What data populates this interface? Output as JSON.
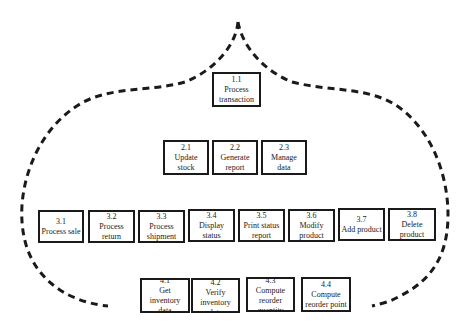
{
  "diagram": {
    "type": "process decomposition chart",
    "outline": "dashed onion-dome boundary",
    "colors": {
      "line": "#1a1a1a",
      "background": "#ffffff"
    },
    "level1": [
      {
        "id": "1.1",
        "label": "Process transaction"
      }
    ],
    "level2": [
      {
        "id": "2.1",
        "label": "Update stock"
      },
      {
        "id": "2.2",
        "label": "Generate report"
      },
      {
        "id": "2.3",
        "label": "Manage data"
      }
    ],
    "level3": [
      {
        "id": "3.1",
        "label": "Process sale"
      },
      {
        "id": "3.2",
        "label": "Process return"
      },
      {
        "id": "3.3",
        "label": "Process shipment"
      },
      {
        "id": "3.4",
        "label": "Display status"
      },
      {
        "id": "3.5",
        "label": "Print status report"
      },
      {
        "id": "3.6",
        "label": "Modify product"
      },
      {
        "id": "3.7",
        "label": "Add product"
      },
      {
        "id": "3.8",
        "label": "Delete product"
      }
    ],
    "level4": [
      {
        "id": "4.1",
        "label": "Get inventory data"
      },
      {
        "id": "4.2",
        "label": "Verify inventory data"
      },
      {
        "id": "4.3",
        "label": "Compute reorder quantity"
      },
      {
        "id": "4.4",
        "label": "Compute reorder point"
      }
    ]
  }
}
